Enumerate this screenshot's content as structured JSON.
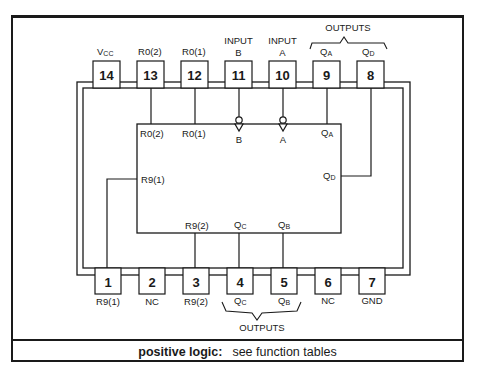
{
  "diagram": {
    "top_pins": [
      {
        "number": "14",
        "label_main": "V",
        "label_sub": "CC"
      },
      {
        "number": "13",
        "label_main": "R",
        "label_sub": "0(2)"
      },
      {
        "number": "12",
        "label_main": "R",
        "label_sub": "0(1)"
      },
      {
        "number": "11",
        "label_line1": "INPUT",
        "label_line2": "B"
      },
      {
        "number": "10",
        "label_line1": "INPUT",
        "label_line2": "A"
      },
      {
        "number": "9",
        "label_main": "Q",
        "label_sub": "A"
      },
      {
        "number": "8",
        "label_main": "Q",
        "label_sub": "D"
      }
    ],
    "top_group_label": "OUTPUTS",
    "bottom_pins": [
      {
        "number": "1",
        "label_main": "R",
        "label_sub": "9(1)"
      },
      {
        "number": "2",
        "label_main": "NC",
        "label_sub": ""
      },
      {
        "number": "3",
        "label_main": "R",
        "label_sub": "9(2)"
      },
      {
        "number": "4",
        "label_main": "Q",
        "label_sub": "C"
      },
      {
        "number": "5",
        "label_main": "Q",
        "label_sub": "B"
      },
      {
        "number": "6",
        "label_main": "NC",
        "label_sub": ""
      },
      {
        "number": "7",
        "label_main": "GND",
        "label_sub": ""
      }
    ],
    "bottom_group_label": "OUTPUTS",
    "block_labels": {
      "r02": {
        "main": "R",
        "sub": "0(2)"
      },
      "r01": {
        "main": "R",
        "sub": "0(1)"
      },
      "b": "B",
      "a": "A",
      "qa": {
        "main": "Q",
        "sub": "A"
      },
      "r91": {
        "main": "R",
        "sub": "9(1)"
      },
      "qd": {
        "main": "Q",
        "sub": "D"
      },
      "r92": {
        "main": "R",
        "sub": "9(2)"
      },
      "qc": {
        "main": "Q",
        "sub": "C"
      },
      "qb": {
        "main": "Q",
        "sub": "B"
      }
    }
  },
  "caption": {
    "label": "positive logic:",
    "text": "see function tables"
  }
}
